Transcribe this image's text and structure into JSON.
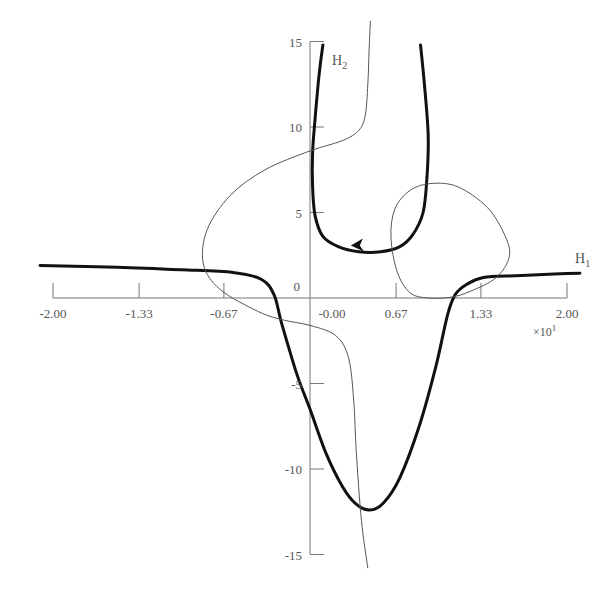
{
  "chart_data": {
    "type": "line",
    "title": "",
    "xlabel": "H1",
    "ylabel": "H2",
    "x_multiplier": "×10¹",
    "xlim": [
      -2.0,
      2.0
    ],
    "ylim": [
      -15,
      15
    ],
    "grid": false,
    "x_ticks": [
      -2.0,
      -1.33,
      -0.67,
      0.67,
      1.33,
      2.0
    ],
    "x_tick_labels": [
      "-2.00",
      "-1.33",
      "-0.67",
      "-0.00",
      "0.67",
      "1.33",
      "2.00"
    ],
    "y_ticks": [
      15,
      10,
      5,
      0,
      -5,
      -10,
      -15
    ],
    "y_tick_labels": [
      "15",
      "10",
      "5",
      "0",
      "-5",
      "-10",
      "-15"
    ],
    "axis_labels": {
      "x": {
        "main": "H",
        "sub": "1"
      },
      "y": {
        "main": "H",
        "sub": "2"
      },
      "multiplier": "×10",
      "multiplier_exp": "1"
    },
    "series": [
      {
        "name": "thick-upper-branch",
        "style": "thick",
        "points": [
          [
            0.1,
            14.8
          ],
          [
            0.07,
            13.0
          ],
          [
            0.04,
            10.5
          ],
          [
            0.02,
            8.5
          ],
          [
            0.02,
            6.5
          ],
          [
            0.04,
            4.8
          ],
          [
            0.1,
            3.6
          ],
          [
            0.22,
            3.0
          ],
          [
            0.38,
            2.7
          ],
          [
            0.55,
            2.7
          ],
          [
            0.7,
            3.0
          ],
          [
            0.8,
            3.7
          ],
          [
            0.88,
            5.0
          ],
          [
            0.91,
            7.0
          ],
          [
            0.92,
            9.5
          ],
          [
            0.89,
            12.5
          ],
          [
            0.86,
            14.8
          ]
        ]
      },
      {
        "name": "thick-lower-branch",
        "style": "thick",
        "points": [
          [
            -2.1,
            1.9
          ],
          [
            -1.5,
            1.8
          ],
          [
            -1.0,
            1.65
          ],
          [
            -0.6,
            1.5
          ],
          [
            -0.38,
            1.1
          ],
          [
            -0.28,
            0.2
          ],
          [
            -0.22,
            -1.5
          ],
          [
            -0.1,
            -4.5
          ],
          [
            0.0,
            -6.5
          ],
          [
            0.12,
            -9.0
          ],
          [
            0.25,
            -11.0
          ],
          [
            0.35,
            -12.0
          ],
          [
            0.46,
            -12.4
          ],
          [
            0.57,
            -12.0
          ],
          [
            0.7,
            -10.5
          ],
          [
            0.85,
            -7.5
          ],
          [
            0.98,
            -4.0
          ],
          [
            1.07,
            -1.0
          ],
          [
            1.13,
            0.2
          ],
          [
            1.22,
            0.8
          ],
          [
            1.35,
            1.2
          ],
          [
            1.6,
            1.3
          ],
          [
            1.9,
            1.4
          ],
          [
            2.1,
            1.45
          ]
        ]
      },
      {
        "name": "thin-curve",
        "style": "thin",
        "points": [
          [
            0.47,
            16.2
          ],
          [
            0.46,
            14.5
          ],
          [
            0.45,
            12.5
          ],
          [
            0.43,
            10.7
          ],
          [
            0.38,
            9.8
          ],
          [
            0.25,
            9.2
          ],
          [
            0.0,
            8.6
          ],
          [
            -0.35,
            7.5
          ],
          [
            -0.62,
            6.0
          ],
          [
            -0.8,
            4.0
          ],
          [
            -0.83,
            2.0
          ],
          [
            -0.7,
            0.5
          ],
          [
            -0.4,
            -0.8
          ],
          [
            -0.2,
            -1.3
          ],
          [
            0.0,
            -1.6
          ],
          [
            0.2,
            -2.2
          ],
          [
            0.3,
            -3.5
          ],
          [
            0.34,
            -6.0
          ],
          [
            0.36,
            -9.0
          ],
          [
            0.4,
            -13.0
          ],
          [
            0.45,
            -15.8
          ]
        ]
      },
      {
        "name": "thin-closed-loop",
        "style": "thin",
        "closed": true,
        "points": [
          [
            0.92,
            0.0
          ],
          [
            0.78,
            0.3
          ],
          [
            0.68,
            1.5
          ],
          [
            0.63,
            3.5
          ],
          [
            0.66,
            5.2
          ],
          [
            0.78,
            6.3
          ],
          [
            0.95,
            6.7
          ],
          [
            1.15,
            6.5
          ],
          [
            1.38,
            5.3
          ],
          [
            1.52,
            3.6
          ],
          [
            1.55,
            2.4
          ],
          [
            1.45,
            1.2
          ],
          [
            1.25,
            0.4
          ],
          [
            1.1,
            0.05
          ]
        ]
      }
    ],
    "annotations": [
      {
        "type": "arrowhead",
        "on": "thick-upper-branch",
        "at": [
          0.38,
          2.9
        ],
        "direction": "left"
      }
    ]
  }
}
